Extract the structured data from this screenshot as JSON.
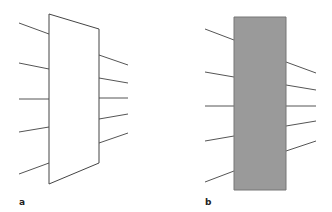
{
  "panels": [
    {
      "label": "a",
      "shape": "trapezoid",
      "fill": "#ffffff",
      "stroke": "#444444",
      "polygon": [
        [
          49,
          14
        ],
        [
          99,
          29
        ],
        [
          99,
          163
        ],
        [
          49,
          184
        ]
      ],
      "left_lines": [
        [
          [
            19,
            23
          ],
          [
            49,
            34
          ]
        ],
        [
          [
            19,
            63
          ],
          [
            49,
            69
          ]
        ],
        [
          [
            19,
            99
          ],
          [
            49,
            99
          ]
        ],
        [
          [
            19,
            132
          ],
          [
            49,
            127
          ]
        ],
        [
          [
            19,
            174
          ],
          [
            49,
            163
          ]
        ]
      ],
      "right_lines": [
        [
          [
            99,
            55
          ],
          [
            128,
            65
          ]
        ],
        [
          [
            99,
            78
          ],
          [
            128,
            83
          ]
        ],
        [
          [
            99,
            98
          ],
          [
            128,
            98
          ]
        ],
        [
          [
            99,
            119
          ],
          [
            128,
            114
          ]
        ],
        [
          [
            99,
            143
          ],
          [
            128,
            133
          ]
        ]
      ]
    },
    {
      "label": "b",
      "shape": "rectangle",
      "fill": "#9a9a9a",
      "stroke": "#777777",
      "polygon": [
        [
          234,
          17
        ],
        [
          286,
          17
        ],
        [
          286,
          190
        ],
        [
          234,
          190
        ]
      ],
      "left_lines": [
        [
          [
            205,
            29
          ],
          [
            234,
            40
          ]
        ],
        [
          [
            205,
            72
          ],
          [
            234,
            77
          ]
        ],
        [
          [
            205,
            106
          ],
          [
            234,
            106
          ]
        ],
        [
          [
            205,
            141
          ],
          [
            234,
            136
          ]
        ],
        [
          [
            205,
            182
          ],
          [
            234,
            171
          ]
        ]
      ],
      "right_lines": [
        [
          [
            286,
            62
          ],
          [
            316,
            73
          ]
        ],
        [
          [
            286,
            85
          ],
          [
            316,
            90
          ]
        ],
        [
          [
            286,
            106
          ],
          [
            316,
            106
          ]
        ],
        [
          [
            286,
            126
          ],
          [
            316,
            121
          ]
        ],
        [
          [
            286,
            151
          ],
          [
            316,
            141
          ]
        ]
      ]
    }
  ]
}
